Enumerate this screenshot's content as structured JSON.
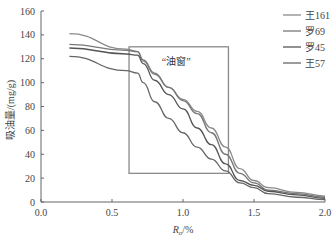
{
  "chart_data": {
    "type": "line",
    "title": "",
    "xlabel": "Ro/%",
    "xlabel_main": "R",
    "xlabel_sub": "o",
    "xlabel_unit": "/%",
    "ylabel": "吸油量/(mg/g)",
    "xlim": [
      0.0,
      2.0
    ],
    "ylim": [
      0,
      160
    ],
    "xticks": [
      0.0,
      0.5,
      1.0,
      1.5,
      2.0
    ],
    "xtick_labels": [
      "0.0",
      "0.5",
      "1.0",
      "1.5",
      "2.0"
    ],
    "yticks": [
      0,
      20,
      40,
      60,
      80,
      100,
      120,
      140,
      160
    ],
    "grid": false,
    "legend_position": "upper right",
    "series": [
      {
        "name": "王161",
        "color": "#8a8a8a",
        "x": [
          0.2,
          0.6,
          0.68,
          0.72,
          0.8,
          0.9,
          1.0,
          1.1,
          1.2,
          1.3,
          1.4,
          1.5,
          1.6,
          1.8,
          2.0
        ],
        "y": [
          141,
          128,
          126,
          118,
          107,
          96,
          86,
          76,
          62,
          46,
          28,
          18,
          12,
          8,
          5
        ]
      },
      {
        "name": "罗69",
        "color": "#777777",
        "x": [
          0.2,
          0.6,
          0.68,
          0.72,
          0.8,
          0.9,
          1.0,
          1.1,
          1.2,
          1.3,
          1.4,
          1.5,
          1.6,
          1.8,
          2.0
        ],
        "y": [
          132,
          127,
          126,
          119,
          108,
          96,
          85,
          74,
          58,
          40,
          24,
          16,
          10,
          7,
          4
        ]
      },
      {
        "name": "罗45",
        "color": "#555555",
        "x": [
          0.2,
          0.6,
          0.68,
          0.72,
          0.8,
          0.9,
          1.0,
          1.1,
          1.2,
          1.3,
          1.4,
          1.5,
          1.6,
          1.8,
          2.0
        ],
        "y": [
          129,
          124,
          123,
          116,
          102,
          90,
          78,
          62,
          48,
          32,
          18,
          14,
          9,
          6,
          3
        ]
      },
      {
        "name": "王57",
        "color": "#666666",
        "x": [
          0.2,
          0.6,
          0.68,
          0.72,
          0.8,
          0.9,
          1.0,
          1.1,
          1.2,
          1.3,
          1.4,
          1.5,
          1.6,
          1.8,
          2.0
        ],
        "y": [
          122,
          110,
          108,
          100,
          84,
          70,
          58,
          46,
          36,
          26,
          16,
          12,
          7,
          4,
          2
        ]
      }
    ],
    "annotations": [
      {
        "type": "rect",
        "x0": 0.62,
        "x1": 1.32,
        "y0": 24,
        "y1": 130,
        "color": "#8a8a8a"
      },
      {
        "type": "text",
        "text": "“油窗”",
        "x": 0.85,
        "y": 115
      }
    ]
  }
}
